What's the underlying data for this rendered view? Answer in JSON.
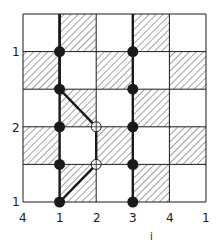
{
  "diagram": {
    "grid": {
      "cols": 5,
      "rows": 5,
      "x0": 23,
      "y0": 14,
      "x1": 206,
      "y1": 202,
      "hatched_rule": "row+col odd"
    },
    "left_labels": [
      {
        "text": "1",
        "row_line": 1
      },
      {
        "text": "2",
        "row_line": 3
      },
      {
        "text": "1",
        "row_line": 5
      }
    ],
    "bottom_labels": [
      "4",
      "1",
      "2",
      "3",
      "4",
      "1"
    ],
    "axis_label": "i",
    "filled_dots": [
      [
        1,
        1
      ],
      [
        1,
        2
      ],
      [
        1,
        3
      ],
      [
        1,
        4
      ],
      [
        1,
        5
      ],
      [
        3,
        1
      ],
      [
        3,
        2
      ],
      [
        3,
        3
      ],
      [
        3,
        4
      ],
      [
        3,
        5
      ]
    ],
    "hollow_dots": [
      [
        2,
        3
      ],
      [
        2,
        4
      ]
    ],
    "thick_paths": [
      [
        [
          1,
          0
        ],
        [
          1,
          2
        ],
        [
          2,
          3
        ],
        [
          2,
          4
        ],
        [
          1,
          5
        ]
      ],
      [
        [
          1,
          0
        ],
        [
          1,
          5
        ]
      ],
      [
        [
          3,
          0
        ],
        [
          3,
          5
        ]
      ]
    ],
    "colors": {
      "line": "#1a1a1a",
      "hatch": "#333333",
      "background": "#ffffff"
    }
  }
}
